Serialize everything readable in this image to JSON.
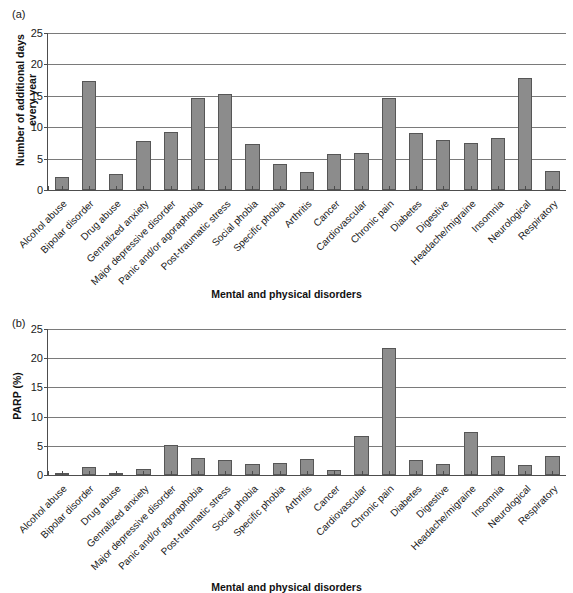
{
  "figure": {
    "panel_a_letter": "(a)",
    "panel_b_letter": "(b)"
  },
  "chart_data": [
    {
      "type": "bar",
      "panel": "(a)",
      "title": "",
      "xlabel": "Mental and physical disorders",
      "ylabel": "Number of additional days every year",
      "ylabel_line1": "Number of additional days",
      "ylabel_line2": "every year",
      "ylim": [
        0,
        25
      ],
      "yticks": [
        0,
        5,
        10,
        15,
        20,
        25
      ],
      "ytick_labels": [
        "0",
        "5",
        "10",
        "15",
        "20",
        "25"
      ],
      "grid": true,
      "legend": "none",
      "bar_color": "#8c8c8c",
      "categories": [
        "Alcohol abuse",
        "Bipolar disorder",
        "Drug abuse",
        "Genralized anxiety",
        "Major depressive disorder",
        "Panic and/or agoraphobia",
        "Post-traumatic stress",
        "Social phobia",
        "Specific phobia",
        "Arthritis",
        "Cancer",
        "Cardiovascular",
        "Chronic pain",
        "Diabetes",
        "Digestive",
        "Headache/migraine",
        "Insomnia",
        "Neurological",
        "Respiratory"
      ],
      "values": [
        2.0,
        17.3,
        2.6,
        7.8,
        9.2,
        14.6,
        15.3,
        7.4,
        4.1,
        2.9,
        5.7,
        5.9,
        14.7,
        9.0,
        7.9,
        7.5,
        8.3,
        17.9,
        3.0
      ]
    },
    {
      "type": "bar",
      "panel": "(b)",
      "title": "",
      "xlabel": "Mental and physical disorders",
      "ylabel": "PARP (%)",
      "ylim": [
        0,
        25
      ],
      "yticks": [
        0,
        5,
        10,
        15,
        20,
        25
      ],
      "ytick_labels": [
        "0",
        "5",
        "10",
        "15",
        "20",
        "25"
      ],
      "grid": true,
      "legend": "none",
      "bar_color": "#8c8c8c",
      "categories": [
        "Alcohol abuse",
        "Bipolar disorder",
        "Drug abuse",
        "Genralized anxiety",
        "Major depressive disorder",
        "Panic and/or agoraphobia",
        "Post-traumatic stress",
        "Social phobia",
        "Specific phobia",
        "Arthritis",
        "Cancer",
        "Cardiovascular",
        "Chronic pain",
        "Diabetes",
        "Digestive",
        "Headache/migraine",
        "Insomnia",
        "Neurological",
        "Respiratory"
      ],
      "values": [
        0.4,
        1.4,
        0.2,
        1.1,
        5.2,
        2.9,
        2.5,
        1.9,
        2.1,
        2.8,
        0.8,
        6.6,
        21.8,
        2.5,
        1.9,
        7.3,
        3.3,
        1.7,
        3.3
      ]
    }
  ]
}
